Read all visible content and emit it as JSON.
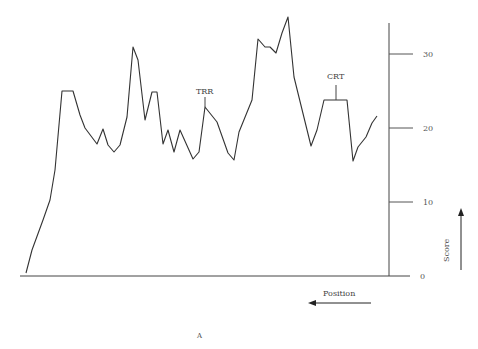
{
  "chart_data": {
    "type": "line",
    "title": "",
    "figure_label": "A",
    "xlabel": "Position",
    "ylabel": "Score",
    "ylim": [
      0,
      35
    ],
    "yticks": [
      0,
      10,
      20,
      30
    ],
    "grid": false,
    "annotations": [
      {
        "text": "TRR",
        "x": 205,
        "score": 22.5
      },
      {
        "text": "CRT",
        "x": 335,
        "score": 23.8
      }
    ],
    "points_px": [
      [
        26,
        273
      ],
      [
        32,
        250
      ],
      [
        43,
        220
      ],
      [
        50,
        200
      ],
      [
        55,
        170
      ],
      [
        62,
        91
      ],
      [
        73,
        91
      ],
      [
        80,
        115
      ],
      [
        85,
        128
      ],
      [
        97,
        144
      ],
      [
        103,
        129
      ],
      [
        108,
        145
      ],
      [
        114,
        152
      ],
      [
        120,
        145
      ],
      [
        127,
        117
      ],
      [
        133,
        47
      ],
      [
        138,
        60
      ],
      [
        145,
        120
      ],
      [
        152,
        92
      ],
      [
        157,
        92
      ],
      [
        163,
        144
      ],
      [
        168,
        130
      ],
      [
        174,
        152
      ],
      [
        180,
        130
      ],
      [
        193,
        159
      ],
      [
        199,
        152
      ],
      [
        205,
        107
      ],
      [
        217,
        122
      ],
      [
        228,
        153
      ],
      [
        234,
        160
      ],
      [
        239,
        132
      ],
      [
        252,
        100
      ],
      [
        258,
        39
      ],
      [
        265,
        47
      ],
      [
        270,
        47
      ],
      [
        276,
        53
      ],
      [
        282,
        33
      ],
      [
        288,
        17
      ],
      [
        294,
        77
      ],
      [
        311,
        146
      ],
      [
        317,
        130
      ],
      [
        324,
        100
      ],
      [
        347,
        100
      ],
      [
        353,
        161
      ],
      [
        358,
        147
      ],
      [
        366,
        137
      ],
      [
        372,
        123
      ],
      [
        377,
        116
      ]
    ],
    "approx_scores": [
      0.4,
      3.5,
      7.6,
      10.3,
      14.3,
      25,
      25,
      21.8,
      20,
      17.8,
      19.9,
      17.7,
      16.8,
      17.7,
      21.5,
      31,
      29.2,
      21.1,
      24.9,
      24.9,
      17.8,
      19.7,
      16.8,
      19.7,
      15.8,
      16.8,
      22.8,
      20.8,
      16.6,
      15.7,
      19.5,
      23.8,
      32.2,
      31,
      31,
      30.3,
      32.9,
      35,
      27,
      17.6,
      19.7,
      23.8,
      23.8,
      15.5,
      17.4,
      18.8,
      20.7,
      21.6
    ]
  }
}
